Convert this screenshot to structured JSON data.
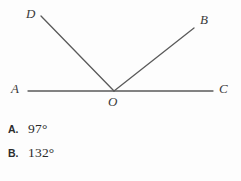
{
  "figure": {
    "type": "angle-diagram",
    "stroke_color": "#5a5a5a",
    "background_color": "#fdfdfd",
    "points": [
      {
        "name": "A",
        "label": "A",
        "x": 18,
        "y": 91
      },
      {
        "name": "B",
        "label": "B",
        "x": 205,
        "y": 21
      },
      {
        "name": "C",
        "label": "C",
        "x": 223,
        "y": 91
      },
      {
        "name": "D",
        "label": "D",
        "x": 32,
        "y": 14
      },
      {
        "name": "O",
        "label": "O",
        "x": 114,
        "y": 101
      }
    ],
    "vertex": {
      "name": "O",
      "x": 114,
      "y": 91
    },
    "segments": [
      {
        "name": "line-AC",
        "from": [
          28,
          91
        ],
        "to": [
          213,
          91
        ]
      },
      {
        "name": "ray-OD",
        "from": [
          114,
          91
        ],
        "to": [
          41,
          16
        ]
      },
      {
        "name": "ray-OB",
        "from": [
          114,
          91
        ],
        "to": [
          194,
          28
        ]
      }
    ]
  },
  "choices": [
    {
      "letter": "A.",
      "value": "97°"
    },
    {
      "letter": "B.",
      "value": "132°"
    }
  ]
}
